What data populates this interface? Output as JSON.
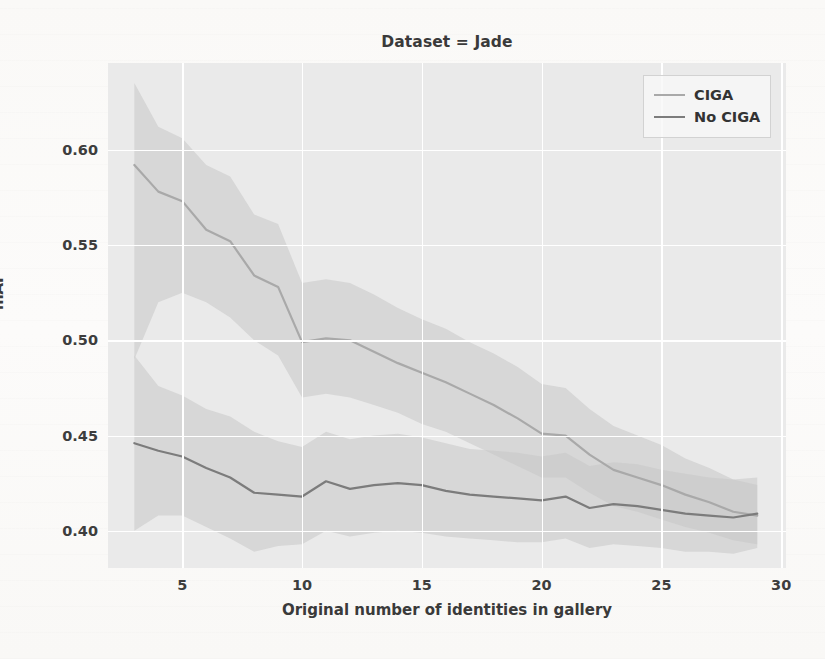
{
  "figure": {
    "title": "Dataset = Jade",
    "xlabel": "Original number of identities in gallery",
    "ylabel": "mAP"
  },
  "legend": {
    "items": [
      {
        "label": "CIGA",
        "color": "#a9a9a9"
      },
      {
        "label": "No CIGA",
        "color": "#7c7c7c"
      }
    ]
  },
  "axes": {
    "xticks": [
      "5",
      "10",
      "15",
      "20",
      "25",
      "30"
    ],
    "yticks": [
      "0.40",
      "0.45",
      "0.50",
      "0.55",
      "0.60"
    ]
  },
  "chart_data": {
    "type": "line",
    "title": "Dataset = Jade",
    "xlabel": "Original number of identities in gallery",
    "ylabel": "mAP",
    "xlim": [
      1.9,
      30.2
    ],
    "ylim": [
      0.3805,
      0.6455
    ],
    "xticks": [
      5,
      10,
      15,
      20,
      25,
      30
    ],
    "yticks": [
      0.4,
      0.45,
      0.5,
      0.55,
      0.6
    ],
    "grid": true,
    "legend_position": "upper right",
    "plot_background": "#eaeaea",
    "gridline_color": "#ffffff",
    "band_description": "shaded confidence interval around each line",
    "x": [
      3,
      4,
      5,
      6,
      7,
      8,
      9,
      10,
      11,
      12,
      13,
      14,
      15,
      16,
      17,
      18,
      19,
      20,
      21,
      22,
      23,
      24,
      25,
      26,
      27,
      28,
      29
    ],
    "series": [
      {
        "name": "CIGA",
        "color": "#a9a9a9",
        "band_color": "#c6c6c6",
        "values": [
          0.592,
          0.578,
          0.573,
          0.558,
          0.552,
          0.534,
          0.528,
          0.499,
          0.501,
          0.5,
          0.494,
          0.488,
          0.483,
          0.478,
          0.472,
          0.466,
          0.459,
          0.451,
          0.45,
          0.44,
          0.432,
          0.428,
          0.424,
          0.419,
          0.415,
          0.41,
          0.408
        ],
        "band_lower": [
          0.49,
          0.52,
          0.525,
          0.52,
          0.512,
          0.5,
          0.492,
          0.47,
          0.472,
          0.47,
          0.466,
          0.462,
          0.456,
          0.452,
          0.446,
          0.44,
          0.434,
          0.428,
          0.428,
          0.42,
          0.413,
          0.41,
          0.406,
          0.402,
          0.399,
          0.395,
          0.393
        ],
        "band_upper": [
          0.635,
          0.612,
          0.606,
          0.592,
          0.586,
          0.566,
          0.561,
          0.53,
          0.532,
          0.53,
          0.524,
          0.517,
          0.511,
          0.506,
          0.499,
          0.493,
          0.486,
          0.477,
          0.475,
          0.464,
          0.455,
          0.45,
          0.445,
          0.438,
          0.433,
          0.427,
          0.424
        ]
      },
      {
        "name": "No CIGA",
        "color": "#7c7c7c",
        "band_color": "#c6c6c6",
        "values": [
          0.446,
          0.442,
          0.439,
          0.433,
          0.428,
          0.42,
          0.419,
          0.418,
          0.426,
          0.422,
          0.424,
          0.425,
          0.424,
          0.421,
          0.419,
          0.418,
          0.417,
          0.416,
          0.418,
          0.412,
          0.414,
          0.413,
          0.411,
          0.409,
          0.408,
          0.407,
          0.409
        ],
        "band_lower": [
          0.4,
          0.408,
          0.408,
          0.402,
          0.396,
          0.389,
          0.392,
          0.393,
          0.4,
          0.397,
          0.399,
          0.4,
          0.399,
          0.397,
          0.396,
          0.395,
          0.394,
          0.394,
          0.396,
          0.391,
          0.393,
          0.392,
          0.391,
          0.389,
          0.389,
          0.388,
          0.391
        ],
        "band_upper": [
          0.492,
          0.476,
          0.471,
          0.464,
          0.46,
          0.452,
          0.447,
          0.444,
          0.452,
          0.448,
          0.45,
          0.451,
          0.449,
          0.446,
          0.443,
          0.442,
          0.441,
          0.439,
          0.441,
          0.434,
          0.436,
          0.435,
          0.432,
          0.43,
          0.428,
          0.427,
          0.428
        ]
      }
    ]
  }
}
